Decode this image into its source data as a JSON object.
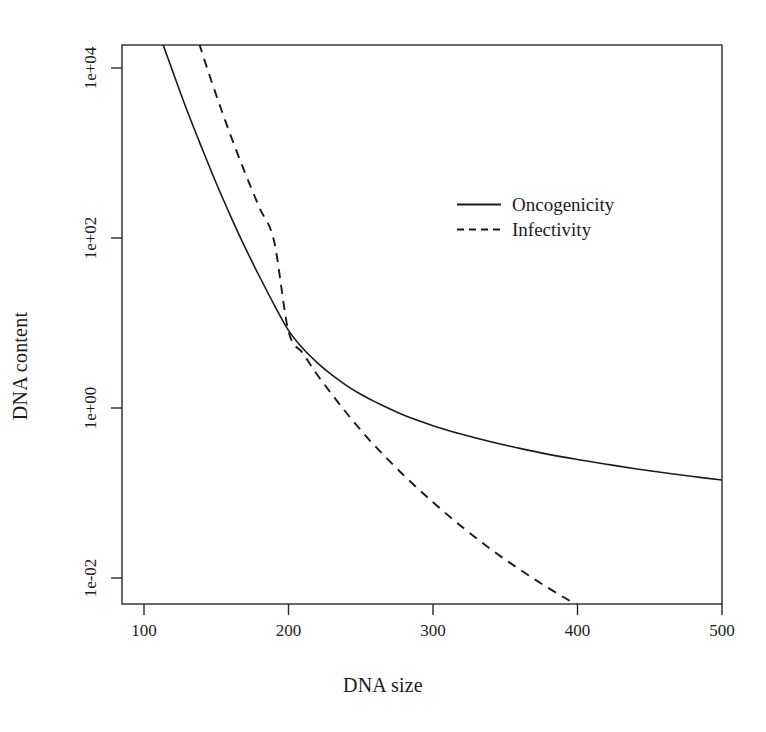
{
  "chart_data": {
    "type": "line",
    "title": "",
    "xlabel": "DNA size",
    "ylabel": "DNA content",
    "xlim": [
      88,
      500
    ],
    "ylim": [
      0.0022,
      100000
    ],
    "yscale": "log",
    "xscale": "linear",
    "grid": false,
    "legend_position": "upper-right-inside",
    "xticks": [
      100,
      200,
      300,
      400,
      500
    ],
    "xticklabels": [
      "100",
      "200",
      "300",
      "400",
      "500"
    ],
    "yticks": [
      0.01,
      1,
      100,
      10000
    ],
    "yticklabels": [
      "1e-02",
      "1e+00",
      "1e+02",
      "1e+04"
    ],
    "series": [
      {
        "name": "Oncogenicity",
        "style": "solid",
        "color": "#1a1a1a",
        "x": [
          100,
          110,
          120,
          130,
          140,
          150,
          160,
          170,
          180,
          190,
          200,
          210,
          220,
          230,
          240,
          250,
          260,
          280,
          300,
          320,
          340,
          360,
          380,
          400,
          420,
          440,
          460,
          480,
          500
        ],
        "y": [
          90000,
          27000,
          9000,
          3100,
          1150,
          440,
          180,
          77,
          35,
          16.5,
          8.2,
          5.0,
          3.4,
          2.45,
          1.85,
          1.45,
          1.18,
          0.82,
          0.62,
          0.49,
          0.4,
          0.335,
          0.285,
          0.248,
          0.218,
          0.193,
          0.173,
          0.156,
          0.142
        ]
      },
      {
        "name": "Infectivity",
        "style": "dashed",
        "color": "#1a1a1a",
        "x": [
          124,
          130,
          140,
          150,
          160,
          170,
          180,
          190,
          200,
          210,
          220,
          230,
          240,
          250,
          260,
          280,
          300,
          320,
          340,
          360,
          380,
          400,
          420,
          440,
          460,
          480,
          500
        ],
        "y": [
          100000,
          55000,
          15500,
          4800,
          1600,
          580,
          225,
          92,
          8.0,
          4.4,
          2.45,
          1.45,
          0.88,
          0.55,
          0.355,
          0.16,
          0.078,
          0.04,
          0.0218,
          0.0126,
          0.0076,
          0.0048,
          0.0032,
          0.0022,
          0.00158,
          0.00118,
          0.0009
        ]
      }
    ]
  },
  "legend": {
    "entries": [
      {
        "label": "Oncogenicity",
        "style": "solid"
      },
      {
        "label": "Infectivity",
        "style": "dashed"
      }
    ]
  },
  "axes": {
    "x_title": "DNA size",
    "y_title": "DNA content",
    "x_tick_labels": [
      "100",
      "200",
      "300",
      "400",
      "500"
    ],
    "y_tick_labels": [
      "1e+04",
      "1e+02",
      "1e+00",
      "1e-02"
    ]
  }
}
